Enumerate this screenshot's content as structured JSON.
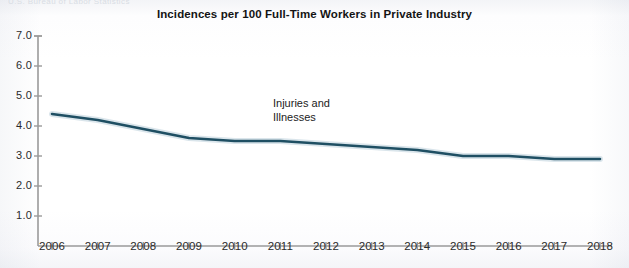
{
  "figure": {
    "ghost_header": "U.S. Bureau of Labor Statistics",
    "width": 629,
    "height": 268
  },
  "chart_data": {
    "type": "line",
    "title": "Incidences per 100 Full-Time Workers in Private Industry",
    "xlabel": "",
    "ylabel": "",
    "x": [
      2006,
      2007,
      2008,
      2009,
      2010,
      2011,
      2012,
      2013,
      2014,
      2015,
      2016,
      2017,
      2018
    ],
    "categories": [
      "2006",
      "2007",
      "2008",
      "2009",
      "2010",
      "2011",
      "2012",
      "2013",
      "2014",
      "2015",
      "2016",
      "2017",
      "2018"
    ],
    "series": [
      {
        "name": "Injuries and Illnesses",
        "color": "#1f4f63",
        "values": [
          4.4,
          4.2,
          3.9,
          3.6,
          3.5,
          3.5,
          3.4,
          3.3,
          3.2,
          3.0,
          3.0,
          2.9,
          2.9
        ]
      }
    ],
    "ylim": [
      0,
      7
    ],
    "yticks": [
      1.0,
      2.0,
      3.0,
      4.0,
      5.0,
      6.0,
      7.0
    ],
    "ytick_labels": [
      "1.0",
      "2.0",
      "3.0",
      "4.0",
      "5.0",
      "6.0",
      "7.0"
    ],
    "grid": false,
    "legend": "none",
    "annotations": [
      {
        "text": "Injuries and\nIllnesses",
        "x": 2011,
        "y": 4.1
      }
    ],
    "axis_color": "#9a9a9a"
  }
}
